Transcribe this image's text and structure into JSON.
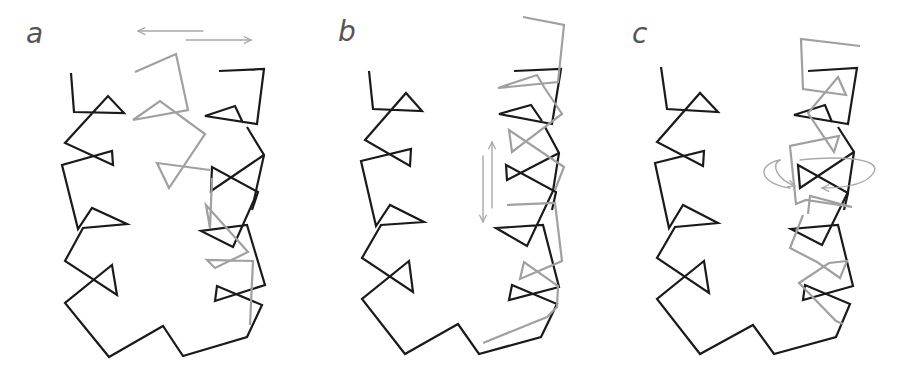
{
  "figure": {
    "colors": {
      "reference": "#1a1a1a",
      "moved": "#a0a0a0",
      "arrow": "#a8a8a8",
      "label": "#555555",
      "background": "#ffffff"
    },
    "panels": [
      {
        "id": "a",
        "label": "a",
        "motion": "lateral translation",
        "arrow_type": "two opposing horizontal arrows"
      },
      {
        "id": "b",
        "label": "b",
        "motion": "vertical (axial) translation",
        "arrow_type": "two opposing vertical arrows"
      },
      {
        "id": "c",
        "label": "c",
        "motion": "rotation about helix axis",
        "arrow_type": "elliptical rotation arrow"
      }
    ]
  }
}
